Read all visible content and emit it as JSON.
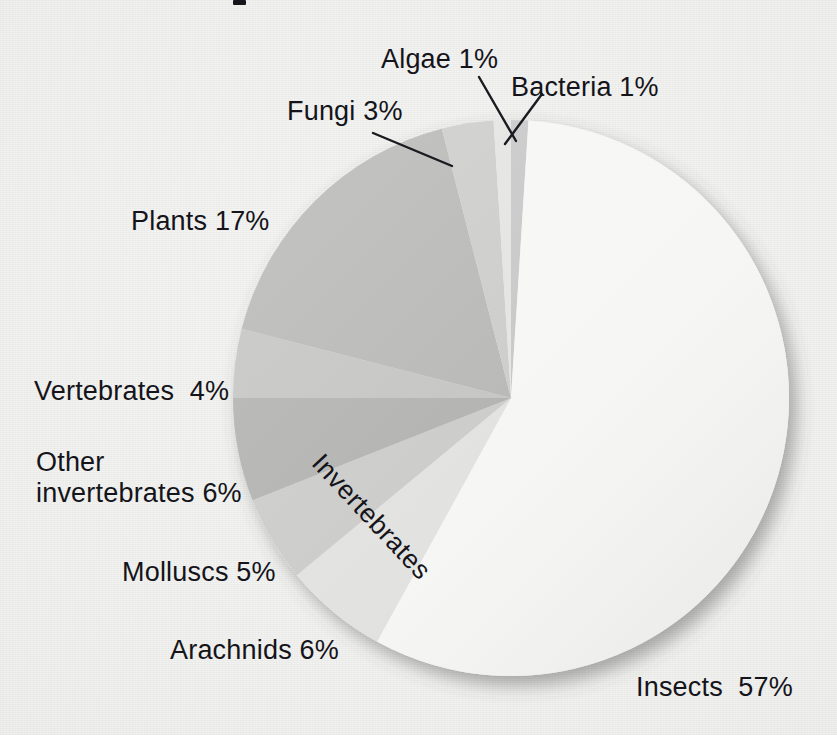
{
  "chart_data": {
    "type": "pie",
    "title": "",
    "xlabel": "",
    "ylabel": "",
    "legend_position": "callout-labels",
    "grid": false,
    "units": "percent",
    "start_angle_deg": 0,
    "direction": "clockwise",
    "total": 100,
    "categories": [
      "Bacteria",
      "Insects",
      "Arachnids",
      "Molluscs",
      "Other invertebrates",
      "Vertebrates",
      "Plants",
      "Fungi",
      "Algae"
    ],
    "values": [
      1,
      57,
      6,
      5,
      6,
      4,
      17,
      3,
      1
    ],
    "slices": [
      {
        "name": "Bacteria",
        "value": 1,
        "label": "Bacteria 1%",
        "color": "#c6c6c6"
      },
      {
        "name": "Insects",
        "value": 57,
        "label": "Insects  57%",
        "color": "#f6f6f4"
      },
      {
        "name": "Arachnids",
        "value": 6,
        "label": "Arachnids 6%",
        "color": "#e1e1df"
      },
      {
        "name": "Molluscs",
        "value": 5,
        "label": "Molluscs 5%",
        "color": "#cacac8"
      },
      {
        "name": "Other invertebrates",
        "value": 6,
        "label": "Other\ninvertebrates 6%",
        "color": "#b0b0ae"
      },
      {
        "name": "Vertebrates",
        "value": 4,
        "label": "Vertebrates  4%",
        "color": "#c3c3c1"
      },
      {
        "name": "Plants",
        "value": 17,
        "label": "Plants 17%",
        "color": "#b6b6b4"
      },
      {
        "name": "Fungi",
        "value": 3,
        "label": "Fungi 3%",
        "color": "#cbcbc9"
      },
      {
        "name": "Algae",
        "value": 1,
        "label": "Algae 1%",
        "color": "#e3e3e1"
      }
    ],
    "group_annotation": {
      "text": "Invertebrates",
      "members": [
        "Insects",
        "Arachnids",
        "Molluscs",
        "Other invertebrates"
      ],
      "rotation_deg": 47
    },
    "callout_leader_lines": [
      "Fungi",
      "Algae",
      "Bacteria"
    ]
  },
  "labels": {
    "algae": "Algae 1%",
    "bacteria": "Bacteria 1%",
    "fungi": "Fungi 3%",
    "plants": "Plants 17%",
    "vertebrates": "Vertebrates  4%",
    "other_invertebrates_line1": "Other",
    "other_invertebrates_line2": "invertebrates 6%",
    "molluscs": "Molluscs 5%",
    "arachnids": "Arachnids 6%",
    "insects": "Insects  57%",
    "invertebrates_group": "Invertebrates"
  },
  "colors": {
    "page_background": "#f2f2f0",
    "text": "#14141a",
    "leader_line": "#1a1a20",
    "slice_insects": "#f6f6f4",
    "slice_arachnids": "#e1e1df",
    "slice_molluscs": "#cacac8",
    "slice_other_invertebrates": "#b0b0ae",
    "slice_vertebrates": "#c3c3c1",
    "slice_plants": "#b6b6b4",
    "slice_fungi": "#cbcbc9",
    "slice_algae": "#e3e3e1",
    "slice_bacteria": "#c6c6c6"
  },
  "geometry": {
    "center_x": 511,
    "center_y": 398,
    "radius": 278
  }
}
